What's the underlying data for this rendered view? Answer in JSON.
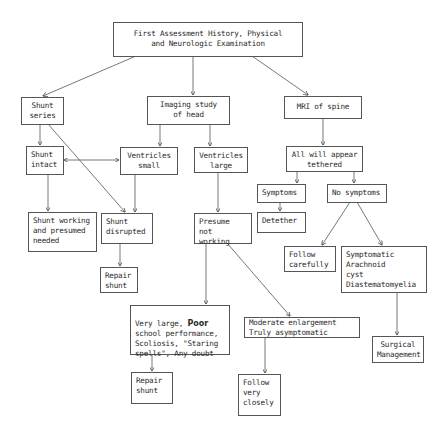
{
  "diagram": {
    "type": "flowchart",
    "nodes": {
      "root": "First Assessment History, Physical\nand Neurologic Examination",
      "shunt_series": "Shunt\nseries",
      "imaging": "Imaging study\nof head",
      "mri": "MRI of spine",
      "shunt_intact": "Shunt\nintact",
      "vent_small": "Ventricles\nsmall",
      "vent_large": "Ventricles\nlarge",
      "tethered": "All will appear\ntethered",
      "symptoms": "Symptoms",
      "no_symptoms": "No symptoms",
      "detether": "Detether",
      "shunt_working": "Shunt working\nand presumed\nneeded",
      "shunt_disrupted": "Shunt\ndisrupted",
      "presume": "Presume\nnot working",
      "follow_carefully": "Follow\ncarefully",
      "symptomatic": "Symptomatic\nArachnoid\ncyst\nDiastematomyelia",
      "repair1": "Repair\nshunt",
      "surgical": "Surgical\nManagement",
      "very_large_a": "Very large, ",
      "very_large_bold": "Poor",
      "very_large_b": "\nschool performance,\nScoliosis, \"Staring\nspells\", Any doubt",
      "moderate": "Moderate enlargement\nTruly asymptomatic",
      "repair2": "Repair\nshunt",
      "follow_closely": "Follow\nvery\nclosely"
    },
    "edges": [
      [
        "root",
        "shunt_series"
      ],
      [
        "root",
        "imaging"
      ],
      [
        "root",
        "mri"
      ],
      [
        "shunt_series",
        "shunt_intact"
      ],
      [
        "shunt_series",
        "shunt_disrupted"
      ],
      [
        "shunt_intact",
        "vent_small",
        "bidirectional"
      ],
      [
        "imaging",
        "vent_small"
      ],
      [
        "imaging",
        "vent_large"
      ],
      [
        "mri",
        "tethered"
      ],
      [
        "tethered",
        "symptoms"
      ],
      [
        "tethered",
        "no_symptoms"
      ],
      [
        "symptoms",
        "detether"
      ],
      [
        "no_symptoms",
        "follow_carefully"
      ],
      [
        "no_symptoms",
        "symptomatic"
      ],
      [
        "shunt_intact",
        "shunt_working"
      ],
      [
        "vent_small",
        "shunt_disrupted"
      ],
      [
        "vent_large",
        "presume"
      ],
      [
        "shunt_disrupted",
        "repair1"
      ],
      [
        "symptomatic",
        "surgical"
      ],
      [
        "presume",
        "very_large"
      ],
      [
        "presume",
        "moderate"
      ],
      [
        "very_large",
        "repair2"
      ],
      [
        "moderate",
        "follow_closely"
      ]
    ]
  }
}
